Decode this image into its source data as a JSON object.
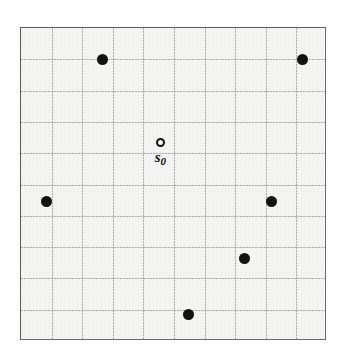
{
  "figure": {
    "kind": "spatial-point-pattern",
    "background_color": "#ffffff",
    "plot": {
      "background_color": "#f5f5f3",
      "border_color": "#5d5d5d",
      "grid_color": "#787878",
      "grid_style": "dotted",
      "grid_columns": 10,
      "grid_rows": 10,
      "left": 20,
      "top": 27,
      "width": 306,
      "height": 313
    }
  },
  "chart_data": {
    "type": "scatter",
    "title": "",
    "subtitle": "",
    "xlabel": "",
    "ylabel": "",
    "xlim": [
      0,
      10
    ],
    "ylim": [
      0,
      10
    ],
    "xticklabels": [],
    "yticklabels": [],
    "grid": true,
    "legend": null,
    "legend_position": "none",
    "annotations": [
      {
        "text": "s0",
        "display": "s",
        "subscript": "0",
        "x": 4.55,
        "y": 6.35,
        "marker": "open-circle"
      }
    ],
    "series": [
      {
        "name": "events",
        "marker": "filled-circle",
        "marker_color": "#121212",
        "marker_size": 11,
        "points": [
          {
            "x": 2.65,
            "y": 9.0
          },
          {
            "x": 9.19,
            "y": 9.0
          },
          {
            "x": 0.82,
            "y": 4.47
          },
          {
            "x": 8.2,
            "y": 4.47
          },
          {
            "x": 7.32,
            "y": 2.65
          },
          {
            "x": 5.49,
            "y": 0.86
          }
        ]
      },
      {
        "name": "reference-location",
        "marker": "open-circle",
        "marker_color": "#111111",
        "marker_size": 9,
        "points": [
          {
            "x": 4.55,
            "y": 6.35
          }
        ]
      }
    ]
  }
}
